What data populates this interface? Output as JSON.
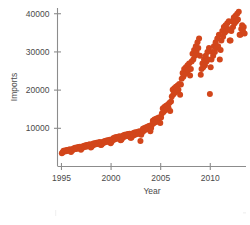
{
  "chart_data": {
    "type": "scatter",
    "title": "",
    "xlabel": "Year",
    "ylabel": "Imports",
    "xlim": [
      1994.6,
      2013.6
    ],
    "ylim": [
      0,
      41500
    ],
    "xticks": [
      1995,
      2000,
      2005,
      2010
    ],
    "xticklabels": [
      "1995",
      "2000",
      "2005",
      "2010"
    ],
    "yticks": [
      10000,
      20000,
      30000,
      40000
    ],
    "yticklabels": [
      "10000",
      "20000",
      "30000",
      "40000"
    ],
    "grid": false,
    "legend": false,
    "marker_color": "#D2461B",
    "marker_size": 3.0,
    "series": [
      {
        "name": "Imports",
        "x": [
          1995.04,
          1995.12,
          1995.21,
          1995.29,
          1995.37,
          1995.46,
          1995.54,
          1995.62,
          1995.71,
          1995.79,
          1995.87,
          1995.96,
          1996.04,
          1996.12,
          1996.21,
          1996.29,
          1996.37,
          1996.46,
          1996.54,
          1996.62,
          1996.71,
          1996.79,
          1996.87,
          1996.96,
          1997.04,
          1997.12,
          1997.21,
          1997.29,
          1997.37,
          1997.46,
          1997.54,
          1997.62,
          1997.71,
          1997.79,
          1997.87,
          1997.96,
          1998.04,
          1998.12,
          1998.21,
          1998.29,
          1998.37,
          1998.46,
          1998.54,
          1998.62,
          1998.71,
          1998.79,
          1998.87,
          1998.96,
          1999.04,
          1999.12,
          1999.21,
          1999.29,
          1999.37,
          1999.46,
          1999.54,
          1999.62,
          1999.71,
          1999.79,
          1999.87,
          1999.96,
          2000.04,
          2000.12,
          2000.21,
          2000.29,
          2000.37,
          2000.46,
          2000.54,
          2000.62,
          2000.71,
          2000.79,
          2000.87,
          2000.96,
          2001.04,
          2001.12,
          2001.21,
          2001.29,
          2001.37,
          2001.46,
          2001.54,
          2001.62,
          2001.71,
          2001.79,
          2001.87,
          2001.96,
          2002.04,
          2002.12,
          2002.21,
          2002.29,
          2002.37,
          2002.46,
          2002.54,
          2002.62,
          2002.71,
          2002.79,
          2002.87,
          2002.96,
          2003.04,
          2003.12,
          2003.21,
          2003.29,
          2003.37,
          2003.46,
          2003.54,
          2003.62,
          2003.71,
          2003.79,
          2003.87,
          2003.96,
          2004.04,
          2004.12,
          2004.21,
          2004.29,
          2004.37,
          2004.46,
          2004.54,
          2004.62,
          2004.71,
          2004.79,
          2004.87,
          2004.96,
          2005.04,
          2005.12,
          2005.21,
          2005.29,
          2005.37,
          2005.46,
          2005.54,
          2005.62,
          2005.71,
          2005.79,
          2005.87,
          2005.96,
          2006.04,
          2006.12,
          2006.21,
          2006.29,
          2006.37,
          2006.46,
          2006.54,
          2006.62,
          2006.71,
          2006.79,
          2006.87,
          2006.96,
          2007.04,
          2007.12,
          2007.21,
          2007.29,
          2007.37,
          2007.46,
          2007.54,
          2007.62,
          2007.71,
          2007.79,
          2007.87,
          2007.96,
          2008.04,
          2008.12,
          2008.21,
          2008.29,
          2008.37,
          2008.46,
          2008.54,
          2008.62,
          2008.71,
          2008.79,
          2008.87,
          2008.96,
          2009.04,
          2009.12,
          2009.21,
          2009.29,
          2009.37,
          2009.46,
          2009.54,
          2009.62,
          2009.71,
          2009.79,
          2009.87,
          2009.96,
          2010.04,
          2010.12,
          2010.21,
          2010.29,
          2010.37,
          2010.46,
          2010.54,
          2010.62,
          2010.71,
          2010.79,
          2010.87,
          2010.96,
          2011.04,
          2011.12,
          2011.21,
          2011.29,
          2011.37,
          2011.46,
          2011.54,
          2011.62,
          2011.71,
          2011.79,
          2011.87,
          2011.96,
          2012.04,
          2012.12,
          2012.21,
          2012.29,
          2012.37,
          2012.46,
          2012.54,
          2012.62,
          2012.71,
          2012.79,
          2012.87,
          2012.96,
          2013.04,
          2013.12,
          2013.21,
          2013.29,
          2013.37,
          2013.46
        ],
        "y": [
          3500,
          3700,
          4100,
          3900,
          4200,
          4000,
          4300,
          4100,
          4400,
          4200,
          4500,
          3800,
          4100,
          4300,
          4700,
          4500,
          4900,
          4600,
          5000,
          4700,
          5100,
          4800,
          5200,
          4400,
          4700,
          4900,
          5400,
          5100,
          5500,
          5200,
          5600,
          5300,
          5700,
          5400,
          5800,
          5000,
          5200,
          5500,
          6000,
          5700,
          6100,
          5800,
          6200,
          5900,
          6300,
          6000,
          6400,
          5600,
          5700,
          6000,
          6500,
          6200,
          6700,
          6400,
          6800,
          6500,
          6900,
          6600,
          7000,
          6100,
          6400,
          6800,
          7400,
          7000,
          7600,
          7200,
          7700,
          7300,
          7800,
          7400,
          7900,
          6900,
          7000,
          7400,
          8100,
          7700,
          8300,
          7900,
          8400,
          8000,
          8500,
          8000,
          8600,
          7500,
          7500,
          7900,
          8700,
          8200,
          8900,
          8400,
          9000,
          8600,
          9100,
          8600,
          9200,
          6700,
          8300,
          8900,
          9900,
          9300,
          10100,
          9600,
          10300,
          9800,
          10500,
          9900,
          10700,
          9200,
          10100,
          10900,
          12000,
          11300,
          12300,
          11600,
          12500,
          11800,
          12700,
          12000,
          12900,
          11400,
          12800,
          13900,
          15200,
          14300,
          15600,
          14700,
          15900,
          15100,
          16200,
          15300,
          16600,
          14500,
          17000,
          18300,
          20100,
          18900,
          20500,
          19400,
          20900,
          19800,
          21200,
          20100,
          21600,
          18800,
          21500,
          23000,
          24500,
          23500,
          25500,
          24200,
          26000,
          24800,
          26500,
          25200,
          27000,
          23800,
          25500,
          27500,
          29500,
          28000,
          30500,
          29000,
          31500,
          30000,
          32500,
          31000,
          33500,
          29000,
          24000,
          25500,
          27000,
          26000,
          28000,
          26500,
          29000,
          27500,
          30000,
          28000,
          31000,
          19000,
          26000,
          28000,
          30000,
          29000,
          31500,
          30000,
          32500,
          31000,
          33500,
          31500,
          34500,
          28000,
          30500,
          33000,
          35500,
          34000,
          36500,
          35000,
          37000,
          35500,
          37500,
          36000,
          38000,
          33000,
          33000,
          35500,
          38000,
          36500,
          39000,
          37500,
          39500,
          38000,
          40000,
          38500,
          40500,
          34500,
          34500,
          36000,
          37000,
          35500,
          36500,
          34800
        ]
      }
    ]
  },
  "axes": {
    "y_title": "Imports",
    "x_title": "Year"
  }
}
